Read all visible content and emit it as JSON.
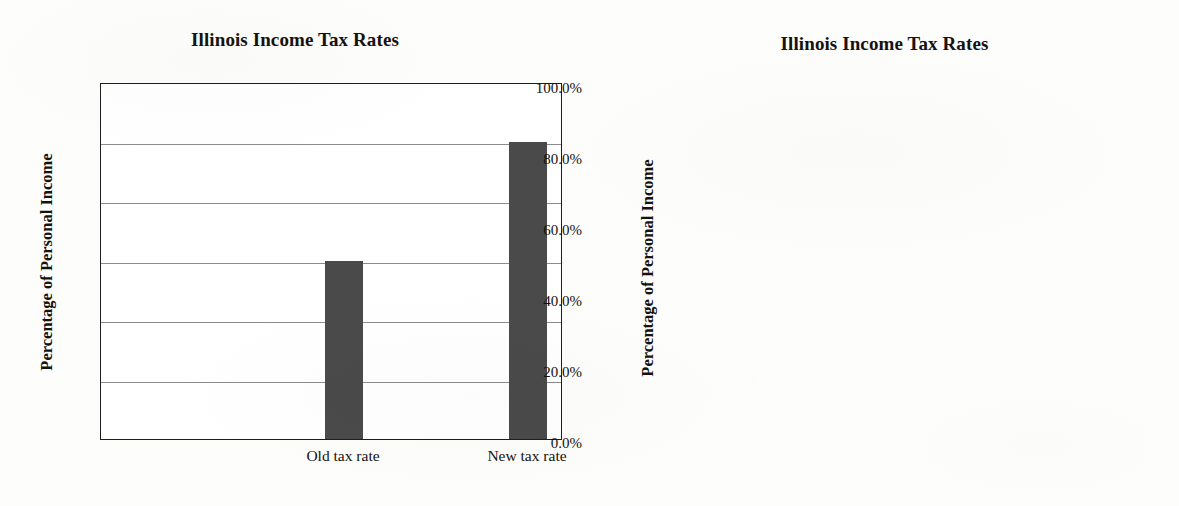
{
  "chart_data": [
    {
      "type": "bar",
      "title": "Illinois Income Tax Rates",
      "xlabel": "",
      "ylabel": "Percentage of Personal Income",
      "categories": [
        "Old tax rate",
        "New tax rate"
      ],
      "values": [
        3.0,
        5.0
      ],
      "value_unit": "%",
      "ylim": [
        0.0,
        6.0
      ],
      "ytick_step": 1.0,
      "yticks": [
        0.0,
        1.0,
        2.0,
        3.0,
        4.0,
        5.0,
        6.0
      ],
      "ytick_labels": [
        "0.0%",
        "1.0%",
        "2.0%",
        "3.0%",
        "4.0%",
        "5.0%",
        "6.0%"
      ],
      "grid": true,
      "grid_axis": "y",
      "legend": false,
      "bar_color": "#4a4a4a",
      "gridline_color": "#8b8b8b",
      "frame_color": "#1d1d1d",
      "plot_background": "#ffffff"
    },
    {
      "type": "bar",
      "title": "Illinois Income Tax Rates",
      "xlabel": "",
      "ylabel": "Percentage of Personal Income",
      "categories": [
        "Old tax rate",
        "New tax rate"
      ],
      "values": [
        3.0,
        5.0
      ],
      "value_unit": "%",
      "ylim": [
        0.0,
        100.0
      ],
      "ytick_step": 20.0,
      "yticks": [
        0.0,
        20.0,
        40.0,
        60.0,
        80.0,
        100.0
      ],
      "ytick_labels": [
        "0.0%",
        "20.0%",
        "40.0%",
        "60.0%",
        "80.0%",
        "100.0%"
      ],
      "grid": true,
      "grid_axis": "y",
      "legend": false,
      "bar_color": "#4a4a4a",
      "gridline_color": "#8b8b8b",
      "frame_color": "#1d1d1d",
      "plot_background": "#ffffff"
    }
  ],
  "charts": [
    {
      "title": "Illinois Income Tax Rates",
      "y_axis_title": "Percentage of Personal Income",
      "ticks": [
        {
          "label": "6.0%",
          "value": 6.0
        },
        {
          "label": "5.0%",
          "value": 5.0
        },
        {
          "label": "4.0%",
          "value": 4.0
        },
        {
          "label": "3.0%",
          "value": 3.0
        },
        {
          "label": "2.0%",
          "value": 2.0
        },
        {
          "label": "1.0%",
          "value": 1.0
        },
        {
          "label": "0.0%",
          "value": 0.0
        }
      ],
      "bars": [
        {
          "label": "Old tax rate",
          "value": 3.0
        },
        {
          "label": "New tax rate",
          "value": 5.0
        }
      ]
    },
    {
      "title": "Illinois Income Tax Rates",
      "y_axis_title": "Percentage of Personal Income",
      "ticks": [
        {
          "label": "100.0%",
          "value": 100.0
        },
        {
          "label": "80.0%",
          "value": 80.0
        },
        {
          "label": "60.0%",
          "value": 60.0
        },
        {
          "label": "40.0%",
          "value": 40.0
        },
        {
          "label": "20.0%",
          "value": 20.0
        },
        {
          "label": "0.0%",
          "value": 0.0
        }
      ],
      "bars": [
        {
          "label": "Old tax rate",
          "value": 3.0
        },
        {
          "label": "New tax rate",
          "value": 5.0
        }
      ]
    }
  ]
}
